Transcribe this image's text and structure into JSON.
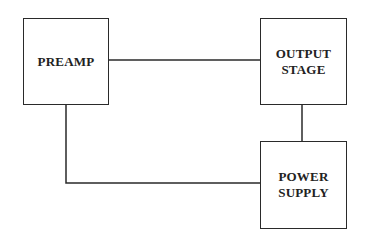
{
  "diagram": {
    "blocks": [
      {
        "id": "preamp",
        "label": "PREAMP"
      },
      {
        "id": "output-stage",
        "label": "OUTPUT\nSTAGE"
      },
      {
        "id": "power-supply",
        "label": "POWER\nSUPPLY"
      }
    ],
    "connections": [
      {
        "from": "preamp",
        "to": "output-stage"
      },
      {
        "from": "output-stage",
        "to": "power-supply"
      },
      {
        "from": "preamp",
        "to": "power-supply"
      }
    ],
    "line_color": "#2a2a2a"
  }
}
